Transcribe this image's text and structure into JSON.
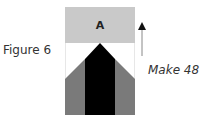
{
  "figure": {
    "label": "Figure 6",
    "instruction": "Make 48",
    "unit_label": "A",
    "colors": {
      "top_band": "#c9c9c9",
      "background": "#ffffff",
      "center": "#000000",
      "sides": "#7a7a7a",
      "outline": "#cfcfcf"
    }
  }
}
